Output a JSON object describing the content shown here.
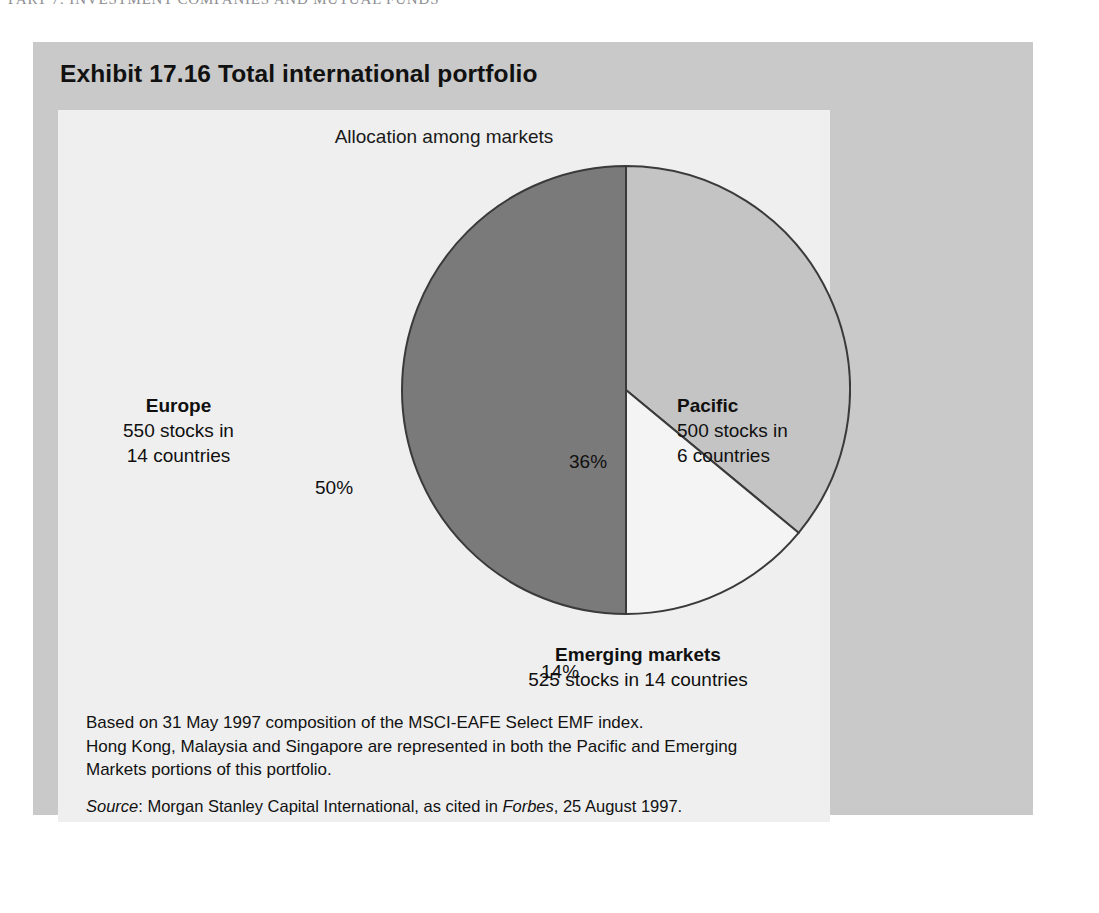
{
  "page": {
    "running_head": "PART 7: INVESTMENT COMPANIES AND MUTUAL FUNDS"
  },
  "exhibit": {
    "label": "Exhibit",
    "number": "17.16",
    "title": "Total international portfolio",
    "title_full": "Exhibit 17.16  Total international portfolio",
    "subtitle": "Allocation among markets",
    "notes": [
      "Based on 31 May 1997 composition of the MSCI-EAFE Select EMF index.",
      "Hong Kong, Malaysia and Singapore are represented in both the Pacific and Emerging",
      "Markets portions of this portfolio."
    ],
    "source": {
      "label": "Source",
      "separator": ": ",
      "text_before": "Morgan Stanley Capital International, as cited in ",
      "publication": "Forbes",
      "text_after": ", 25 August 1997."
    }
  },
  "callouts": {
    "europe": {
      "heading": "Europe",
      "line1": "550 stocks in",
      "line2": "14 countries"
    },
    "pacific": {
      "heading": "Pacific",
      "line1": "500 stocks in",
      "line2": "6 countries"
    },
    "emerging": {
      "heading": "Emerging markets",
      "line1": "525 stocks in 14 countries",
      "line2": ""
    }
  },
  "slice_labels": {
    "europe": "50%",
    "pacific": "36%",
    "emerging": "14%"
  },
  "colors": {
    "panel_grey": "#c9c9c9",
    "figure_bg": "#efefef",
    "europe_slice": "#7a7a7a",
    "pacific_slice": "#c4c4c4",
    "emerging_slice": "#f4f4f4",
    "slice_outline": "#3a3a3a",
    "text": "#101010"
  },
  "chart_data": {
    "type": "pie",
    "title": "Total international portfolio",
    "subtitle": "Allocation among markets",
    "categories": [
      "Europe",
      "Pacific",
      "Emerging markets"
    ],
    "values": [
      50,
      36,
      14
    ],
    "unit": "%",
    "labels": [
      "50%",
      "36%",
      "14%"
    ],
    "slice_colors": [
      "#7a7a7a",
      "#c4c4c4",
      "#f4f4f4"
    ],
    "start_angle_deg": 0,
    "direction": "counter-clockwise-from-top-for-europe",
    "legend": "callout-labels",
    "annotations": [
      "Europe: 550 stocks in 14 countries",
      "Pacific: 500 stocks in 6 countries",
      "Emerging markets: 525 stocks in 14 countries"
    ],
    "grid": false
  }
}
